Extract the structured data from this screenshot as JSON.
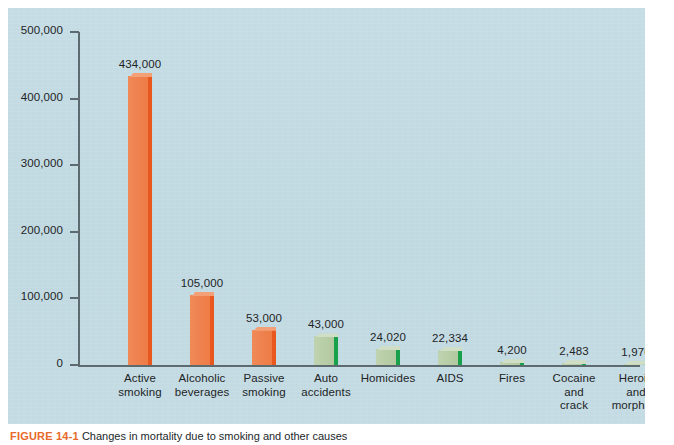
{
  "figure": {
    "caption_tag": "FIGURE 14-1",
    "caption_text": "Changes in mortality due to smoking and other causes",
    "accent_color": "#e8692a",
    "panel_color": "#c3dbe3"
  },
  "chart_data": {
    "type": "bar",
    "title": "",
    "xlabel": "",
    "ylabel": "",
    "ylim": [
      0,
      500000
    ],
    "grid": false,
    "legend": "none",
    "y_ticks": [
      "0",
      "100,000",
      "200,000",
      "300,000",
      "400,000",
      "500,000"
    ],
    "y_tick_values": [
      0,
      100000,
      200000,
      300000,
      400000,
      500000
    ],
    "categories": [
      "Active smoking",
      "Alcoholic beverages",
      "Passive smoking",
      "Auto accidents",
      "Homicides",
      "AIDS",
      "Fires",
      "Cocaine and crack",
      "Heroin and morphine"
    ],
    "values": [
      434000,
      105000,
      53000,
      43000,
      24020,
      22334,
      4200,
      2483,
      1976
    ],
    "value_labels": [
      "434,000",
      "105,000",
      "53,000",
      "43,000",
      "24,020",
      "22,334",
      "4,200",
      "2,483",
      "1,976"
    ],
    "colors": [
      "orange",
      "orange",
      "orange",
      "green",
      "green",
      "green",
      "green",
      "green",
      "green"
    ],
    "color_hex": {
      "orange_face": "#ee7f4c",
      "orange_side": "#e8571d",
      "green_face": "#b9cfa8",
      "green_side": "#19a04a"
    },
    "bars": [
      {
        "label_line1": "Active",
        "label_line2": "smoking",
        "label_line3": "",
        "value_label": "434,000",
        "value": 434000,
        "color": "orange"
      },
      {
        "label_line1": "Alcoholic",
        "label_line2": "beverages",
        "label_line3": "",
        "value_label": "105,000",
        "value": 105000,
        "color": "orange"
      },
      {
        "label_line1": "Passive",
        "label_line2": "smoking",
        "label_line3": "",
        "value_label": "53,000",
        "value": 53000,
        "color": "orange"
      },
      {
        "label_line1": "Auto",
        "label_line2": "accidents",
        "label_line3": "",
        "value_label": "43,000",
        "value": 43000,
        "color": "green"
      },
      {
        "label_line1": "Homicides",
        "label_line2": "",
        "label_line3": "",
        "value_label": "24,020",
        "value": 24020,
        "color": "green"
      },
      {
        "label_line1": "AIDS",
        "label_line2": "",
        "label_line3": "",
        "value_label": "22,334",
        "value": 22334,
        "color": "green"
      },
      {
        "label_line1": "Fires",
        "label_line2": "",
        "label_line3": "",
        "value_label": "4,200",
        "value": 4200,
        "color": "green"
      },
      {
        "label_line1": "Cocaine",
        "label_line2": "and",
        "label_line3": "crack",
        "value_label": "2,483",
        "value": 2483,
        "color": "green"
      },
      {
        "label_line1": "Heroin",
        "label_line2": "and",
        "label_line3": "morphine",
        "value_label": "1,976",
        "value": 1976,
        "color": "green"
      }
    ]
  }
}
